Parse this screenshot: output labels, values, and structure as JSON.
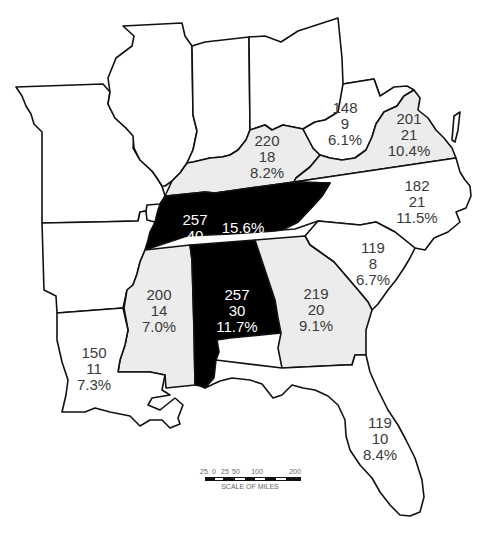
{
  "map": {
    "states": [
      {
        "id": "missouri",
        "shade": "white",
        "lines": []
      },
      {
        "id": "illinois",
        "shade": "white",
        "lines": []
      },
      {
        "id": "indiana",
        "shade": "white",
        "lines": []
      },
      {
        "id": "ohio",
        "shade": "white",
        "lines": []
      },
      {
        "id": "arkansas",
        "shade": "white",
        "lines": []
      },
      {
        "id": "kentucky",
        "shade": "gray",
        "lines": [
          "220",
          "18",
          "8.2%"
        ]
      },
      {
        "id": "west-virginia",
        "shade": "white",
        "lines": [
          "148",
          "9",
          "6.1%"
        ]
      },
      {
        "id": "virginia",
        "shade": "gray",
        "lines": [
          "201",
          "21",
          "10.4%"
        ]
      },
      {
        "id": "tennessee",
        "shade": "black",
        "lines": [
          "257",
          "40",
          "15.6%"
        ]
      },
      {
        "id": "north-carolina",
        "shade": "white",
        "lines": [
          "182",
          "21",
          "11.5%"
        ]
      },
      {
        "id": "south-carolina",
        "shade": "white",
        "lines": [
          "119",
          "8",
          "6.7%"
        ]
      },
      {
        "id": "mississippi",
        "shade": "gray",
        "lines": [
          "200",
          "14",
          "7.0%"
        ]
      },
      {
        "id": "alabama",
        "shade": "black",
        "lines": [
          "257",
          "30",
          "11.7%"
        ]
      },
      {
        "id": "georgia",
        "shade": "gray",
        "lines": [
          "219",
          "20",
          "9.1%"
        ]
      },
      {
        "id": "louisiana",
        "shade": "white",
        "lines": [
          "150",
          "11",
          "7.3%"
        ]
      },
      {
        "id": "florida",
        "shade": "white",
        "lines": [
          "119",
          "10",
          "8.4%"
        ]
      }
    ],
    "shade_colors": {
      "white": "#ffffff",
      "gray": "#ececec",
      "black": "#000000"
    },
    "scale": {
      "ticks": [
        "25",
        "0",
        "25",
        "50",
        "100",
        "200"
      ],
      "label": "SCALE OF MILES"
    }
  }
}
